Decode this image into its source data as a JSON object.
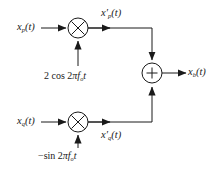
{
  "diagram": {
    "background_color": "#ffffff",
    "line_color": "#1a1a1a",
    "inputs": [
      {
        "id": "xp",
        "label_html": "x<sub>p</sub>(t)",
        "plain": "x_p(t)",
        "branch": "in-phase"
      },
      {
        "id": "xq",
        "label_html": "x<sub>q</sub>(t)",
        "plain": "x_q(t)",
        "branch": "quadrature"
      }
    ],
    "intermediates": [
      {
        "id": "xpp",
        "label_html": "x&#8242;<sub>p</sub>(t)",
        "plain": "x'_p(t)",
        "branch": "in-phase"
      },
      {
        "id": "xqp",
        "label_html": "x&#8242;<sub>q</sub>(t)",
        "plain": "x'_q(t)",
        "branch": "quadrature"
      }
    ],
    "output": {
      "id": "xb",
      "label_html": "x<sub>b</sub>(t)",
      "plain": "x_b(t)"
    },
    "carriers": [
      {
        "id": "cos",
        "label_html": "2 cos 2<i>&#960;f</i><sub>o</sub><i>t</i>",
        "plain": "2 cos 2πf_o t",
        "feeds": "multiplier-top"
      },
      {
        "id": "sin",
        "label_html": "&#8722;sin 2<i>&#960;f</i><sub>o</sub><i>t</i>",
        "plain": "−sin 2πf_o t",
        "feeds": "multiplier-bottom"
      }
    ],
    "operators": [
      {
        "id": "multiplier-top",
        "type": "multiplier",
        "glyph": "×",
        "cx": 78,
        "cy": 28,
        "r": 10
      },
      {
        "id": "multiplier-bottom",
        "type": "multiplier",
        "glyph": "×",
        "cx": 78,
        "cy": 122,
        "r": 10
      },
      {
        "id": "adder",
        "type": "adder",
        "glyph": "+",
        "cx": 152,
        "cy": 73,
        "r": 10
      }
    ]
  }
}
